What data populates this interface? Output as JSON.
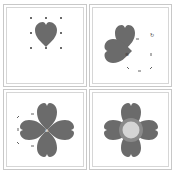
{
  "figure": {
    "colors": {
      "heart_fill": "#6b6b6b",
      "center_fill": "#d4d4d4",
      "center_ring": "#8a8a8a",
      "border": "#c8c8c8",
      "handle": "#3a3a3a",
      "background": "#ffffff"
    },
    "panels": [
      {
        "id": "step-1",
        "label": "Single heart selected with 8 handles"
      },
      {
        "id": "step-2",
        "label": "Duplicated heart rotated 90 degrees"
      },
      {
        "id": "step-3",
        "label": "Four hearts arranged as a clover"
      },
      {
        "id": "step-4",
        "label": "Clover with circle in center"
      }
    ]
  }
}
